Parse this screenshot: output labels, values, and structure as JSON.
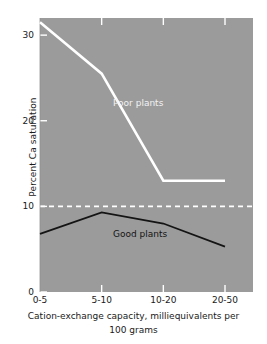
{
  "chart_data": {
    "type": "line",
    "title": "",
    "subtitle": "",
    "xlabel_line1": "Cation-exchange capacity, milliequivalents per",
    "xlabel_line2": "100 grams",
    "ylabel": "Percent Ca saturation",
    "categories": [
      "0-5",
      "5-10",
      "10-20",
      "20-50"
    ],
    "ylim": [
      0,
      32
    ],
    "yticks": [
      0,
      10,
      20,
      30
    ],
    "ytick_labels": [
      "0",
      "10",
      "20",
      "30"
    ],
    "grid": false,
    "legend_position": "inline-annotations",
    "plot_background": "#9b9b9b",
    "series": [
      {
        "name": "Poor plants",
        "values": [
          31.5,
          25.5,
          13.0,
          13.0
        ],
        "color": "#ffffff",
        "style": "solid",
        "annotation": "Poor plants",
        "annotation_color": "#f2f2f2"
      },
      {
        "name": "Good plants",
        "values": [
          6.8,
          9.3,
          8.0,
          5.3
        ],
        "color": "#141414",
        "style": "solid",
        "annotation": "Good plants",
        "annotation_color": "#141414"
      }
    ],
    "reference_line": {
      "name": "critical level",
      "value": 10,
      "style": "dashed",
      "color": "#ffffff"
    },
    "axis_ticks_color": "#ffffff"
  }
}
